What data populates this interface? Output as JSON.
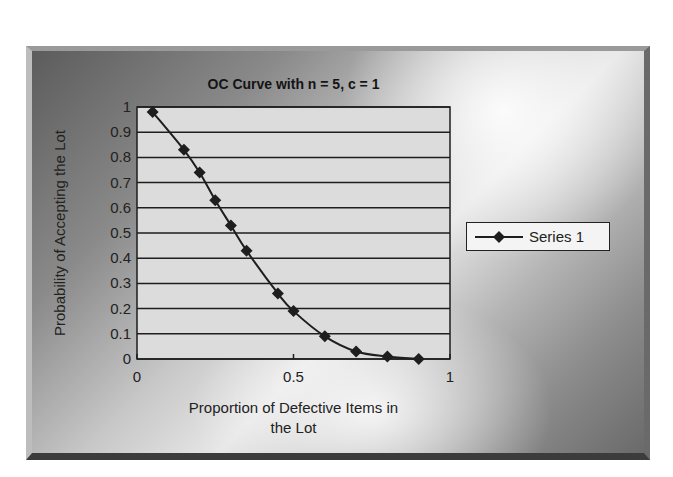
{
  "chart_data": {
    "type": "line",
    "title": "OC Curve with n = 5, c = 1",
    "xlabel": "Proportion of Defective Items in the Lot",
    "ylabel": "Probability of Accepting the Lot",
    "xlim": [
      0,
      1
    ],
    "ylim": [
      0,
      1
    ],
    "x_ticks": [
      "0",
      "0.5",
      "1"
    ],
    "y_ticks": [
      "0",
      "0.1",
      "0.2",
      "0.3",
      "0.4",
      "0.5",
      "0.6",
      "0.7",
      "0.8",
      "0.9",
      "1"
    ],
    "grid": "horizontal",
    "legend_position": "right",
    "marker": "diamond",
    "series": [
      {
        "name": "Series 1",
        "x": [
          0.05,
          0.15,
          0.2,
          0.25,
          0.3,
          0.35,
          0.45,
          0.5,
          0.6,
          0.7,
          0.8,
          0.9
        ],
        "values": [
          0.98,
          0.83,
          0.74,
          0.63,
          0.53,
          0.43,
          0.26,
          0.19,
          0.09,
          0.03,
          0.01,
          0.0
        ]
      }
    ]
  },
  "colors": {
    "plot_background": "#dcdcdc",
    "line": "#1e1e1e",
    "gridline": "#1e1e1e"
  },
  "legend": {
    "label": "Series 1"
  }
}
